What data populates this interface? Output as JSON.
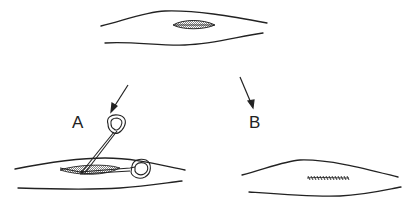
{
  "figure": {
    "type": "surgical-procedure-diagram",
    "panels": [
      {
        "id": "top",
        "content": "limb with open elliptical wound"
      },
      {
        "id": "A",
        "label": "A",
        "content": "limb with scissors inserted into wound"
      },
      {
        "id": "B",
        "label": "B",
        "content": "limb with sutured wound"
      }
    ],
    "labels": {
      "a": "A",
      "b": "B"
    },
    "colors": {
      "line": "#222222",
      "background": "#ffffff"
    }
  }
}
